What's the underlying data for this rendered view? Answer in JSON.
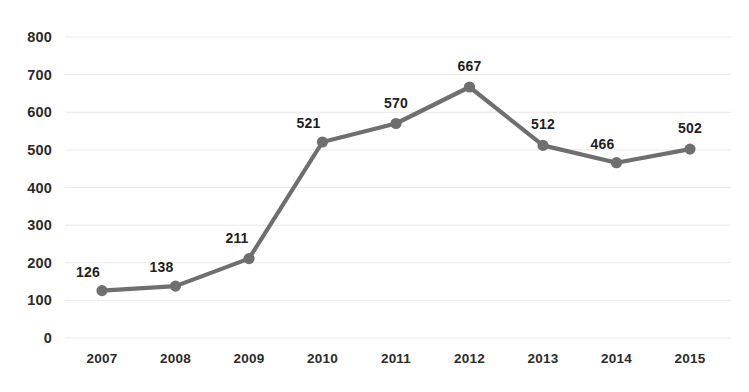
{
  "chart_data": {
    "type": "line",
    "title": "",
    "subtitle": "",
    "xlabel": "",
    "ylabel": "",
    "categories": [
      "2007",
      "2008",
      "2009",
      "2010",
      "2011",
      "2012",
      "2013",
      "2014",
      "2015"
    ],
    "values": [
      126,
      138,
      211,
      521,
      570,
      667,
      512,
      466,
      502
    ],
    "point_labels": [
      "126",
      "138",
      "211",
      "521",
      "570",
      "667",
      "512",
      "466",
      "502"
    ],
    "ylim": [
      0,
      800
    ],
    "ytick_values": [
      800,
      700,
      600,
      500,
      400,
      300,
      200,
      100,
      0
    ],
    "ytick_labels": [
      "800",
      "700",
      "600",
      "500",
      "400",
      "300",
      "200",
      "100",
      "0"
    ],
    "grid": true,
    "grid_axis": "y",
    "legend": false,
    "legend_position": "none",
    "marker": "circle",
    "series_name": "",
    "colors": {
      "line": "#6f6f6f",
      "marker": "#6f6f6f",
      "grid": "#e8e8e8",
      "axis_text": "#2b2b2b",
      "label_text": "#1f1f1f",
      "background": "#ffffff"
    },
    "label_offsets": [
      {
        "dx": -14,
        "dy": -26
      },
      {
        "dx": -14,
        "dy": -26
      },
      {
        "dx": -12,
        "dy": -28
      },
      {
        "dx": -14,
        "dy": -26
      },
      {
        "dx": 0,
        "dy": -28
      },
      {
        "dx": 0,
        "dy": -28
      },
      {
        "dx": 0,
        "dy": -28
      },
      {
        "dx": -14,
        "dy": -26
      },
      {
        "dx": 0,
        "dy": -28
      }
    ]
  }
}
